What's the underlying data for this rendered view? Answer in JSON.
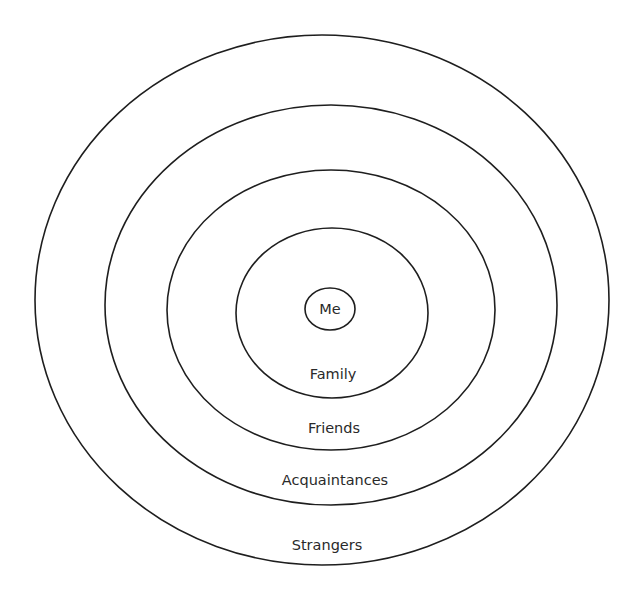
{
  "diagram": {
    "type": "concentric-circles",
    "title": "",
    "center": {
      "label": "Me"
    },
    "rings": [
      {
        "label": "Family"
      },
      {
        "label": "Friends"
      },
      {
        "label": "Acquaintances"
      },
      {
        "label": "Strangers"
      }
    ],
    "colors": {
      "stroke": "#1e1e1e",
      "text": "#2a2a2a",
      "background": "#ffffff"
    }
  }
}
